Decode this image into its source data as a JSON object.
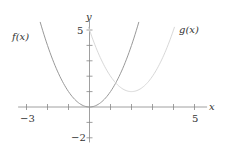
{
  "chart_data": {
    "type": "line",
    "title": "",
    "xlabel": "x",
    "ylabel": "y",
    "xlim": [
      -3.4,
      5.6
    ],
    "ylim": [
      -2.3,
      5.6
    ],
    "x_ticks": [
      -3,
      -2,
      -1,
      1,
      2,
      3,
      4,
      5
    ],
    "y_ticks": [
      -2,
      -1,
      1,
      2,
      3,
      4,
      5
    ],
    "x_tick_labels": [
      {
        "value": -3,
        "label": "−3"
      },
      {
        "value": 5,
        "label": "5"
      }
    ],
    "y_tick_labels": [
      {
        "value": 5,
        "label": "5"
      },
      {
        "value": -2,
        "label": "−2"
      }
    ],
    "grid": false,
    "series": [
      {
        "name": "f(x)",
        "expression": "x^2",
        "color": "#999999",
        "style": "solid",
        "x": [
          -2.3,
          -2,
          -1.5,
          -1,
          -0.5,
          0,
          0.5,
          1,
          1.5,
          2,
          2.3
        ],
        "y": [
          5.29,
          4,
          2.25,
          1,
          0.25,
          0,
          0.25,
          1,
          2.25,
          4,
          5.29
        ]
      },
      {
        "name": "g(x)",
        "expression": "(x-2)^2+1",
        "color": "#d8d8d8",
        "style": "solid",
        "x": [
          0,
          0.5,
          1,
          1.5,
          2,
          2.5,
          3,
          3.5,
          4
        ],
        "y": [
          5,
          3.25,
          2,
          1.25,
          1,
          1.25,
          2,
          3.25,
          5
        ]
      }
    ],
    "annotations": [
      {
        "text": "f(x)",
        "x": -3.2,
        "y": 4.6
      },
      {
        "text": "g(x)",
        "x": 4.2,
        "y": 4.6
      }
    ]
  },
  "labels": {
    "x_axis": "x",
    "y_axis": "y",
    "f_label": "f(x)",
    "g_label": "g(x)",
    "tick_x_neg3": "−3",
    "tick_x_5": "5",
    "tick_y_5": "5",
    "tick_y_neg2": "−2"
  }
}
